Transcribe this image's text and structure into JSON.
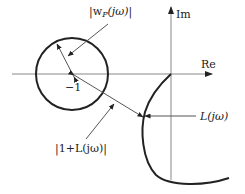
{
  "diagram": {
    "type": "nyquist-plot-robust-performance",
    "axes": {
      "real_label": "Re",
      "imag_label": "Im"
    },
    "point_label": "−1",
    "labels": {
      "weight_radius": "|w",
      "weight_sub": "P",
      "weight_tail": "(jω)|",
      "distance": "|1+L(jω)|",
      "curve": "L(jω)"
    },
    "colors": {
      "axis": "#888888",
      "curve": "#222222",
      "circle": "#222222",
      "pointer": "#555555",
      "text": "#222222"
    }
  }
}
